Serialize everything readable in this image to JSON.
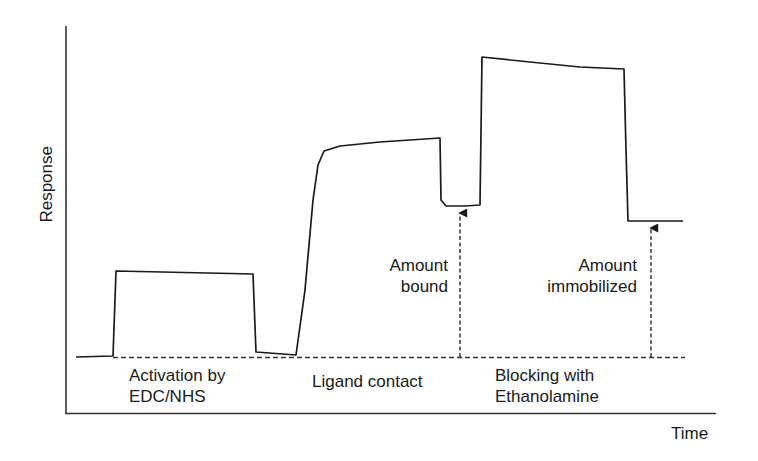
{
  "chart_data": {
    "type": "line",
    "title": "",
    "xlabel": "Time",
    "ylabel": "Response",
    "grid": false,
    "legend": null,
    "series": [
      {
        "name": "sensorgram",
        "color": "#1a1a1a",
        "points": [
          [
            76,
            357
          ],
          [
            113,
            356
          ],
          [
            116,
            271
          ],
          [
            253,
            274
          ],
          [
            256,
            352
          ],
          [
            296,
            355
          ],
          [
            305,
            290
          ],
          [
            313,
            200
          ],
          [
            318,
            165
          ],
          [
            324,
            151
          ],
          [
            340,
            146
          ],
          [
            380,
            142
          ],
          [
            440,
            138
          ],
          [
            441,
            200
          ],
          [
            446,
            206
          ],
          [
            465,
            206
          ],
          [
            480,
            205
          ],
          [
            482,
            57
          ],
          [
            520,
            61
          ],
          [
            580,
            67
          ],
          [
            624,
            69
          ],
          [
            626,
            150
          ],
          [
            628,
            221
          ],
          [
            683,
            221
          ]
        ]
      }
    ],
    "baseline": {
      "style": "dashed",
      "y": 357,
      "x_start": 113,
      "x_end": 685
    },
    "phases": [
      {
        "label_line1": "Activation by",
        "label_line2": "EDC/NHS"
      },
      {
        "label_line1": "Ligand contact",
        "label_line2": ""
      },
      {
        "label_line1": "Blocking with",
        "label_line2": "Ethanolamine"
      }
    ],
    "annotations": [
      {
        "label_line1": "Amount",
        "label_line2": "bound",
        "arrow_x": 460,
        "arrow_from_y": 357,
        "arrow_to_y": 208,
        "style": "dashed-arrow"
      },
      {
        "label_line1": "Amount",
        "label_line2": "immobilized",
        "arrow_x": 651,
        "arrow_from_y": 357,
        "arrow_to_y": 223,
        "style": "dashed-arrow"
      }
    ],
    "axes": {
      "y_axis": {
        "x": 66,
        "y_top": 26,
        "y_bottom": 413,
        "ticks": []
      },
      "x_axis": {
        "y": 413,
        "x_left": 66,
        "x_right": 716,
        "ticks": []
      }
    }
  },
  "labels": {
    "ylabel": "Response",
    "xlabel": "Time",
    "phase1_line1": "Activation by",
    "phase1_line2": "EDC/NHS",
    "phase2_line1": "Ligand contact",
    "phase3_line1": "Blocking with",
    "phase3_line2": "Ethanolamine",
    "ann1_line1": "Amount",
    "ann1_line2": "bound",
    "ann2_line1": "Amount",
    "ann2_line2": "immobilized"
  },
  "colors": {
    "ink": "#1a1a1a",
    "background": "#ffffff"
  }
}
